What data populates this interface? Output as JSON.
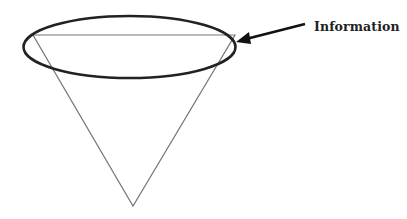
{
  "diagram": {
    "label": "Information",
    "shapes": {
      "funnel": {
        "type": "inverted-triangle",
        "top_left": [
          33,
          35
        ],
        "top_right": [
          235,
          35
        ],
        "apex": [
          133,
          206
        ],
        "stroke": "#777777"
      },
      "highlight_ellipse": {
        "cx": 129.5,
        "cy": 47,
        "rx": 106,
        "ry": 31,
        "stroke": "#222222"
      },
      "arrow": {
        "from": [
          305,
          24
        ],
        "to": [
          236,
          42
        ],
        "stroke": "#111111",
        "points_to": "top of funnel"
      }
    }
  }
}
